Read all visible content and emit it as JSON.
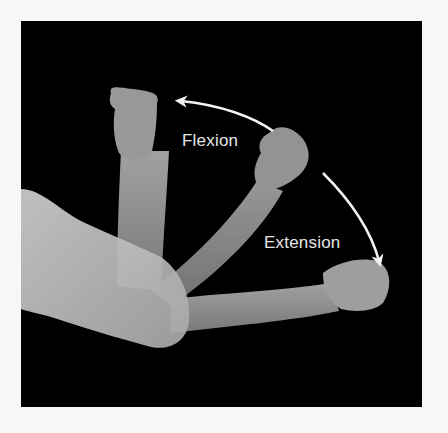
{
  "figure": {
    "background_color": "#000000",
    "page_color": "#f7f7f7",
    "skin_tone": "#bdbdbd",
    "arrow_color": "#f2f2f2"
  },
  "labels": {
    "flexion": "Flexion",
    "extension": "Extension"
  },
  "arrows": [
    {
      "name": "flexion-arrow",
      "direction": "toward raised fist (flexed position)"
    },
    {
      "name": "extension-arrow",
      "direction": "toward extended fist (straight position)"
    }
  ],
  "arm_positions": [
    {
      "name": "flexed-forearm",
      "description": "forearm vertical, fist raised"
    },
    {
      "name": "mid-forearm",
      "description": "forearm diagonal, fist at mid angle"
    },
    {
      "name": "extended-forearm",
      "description": "forearm horizontal, fist extended to right"
    }
  ]
}
